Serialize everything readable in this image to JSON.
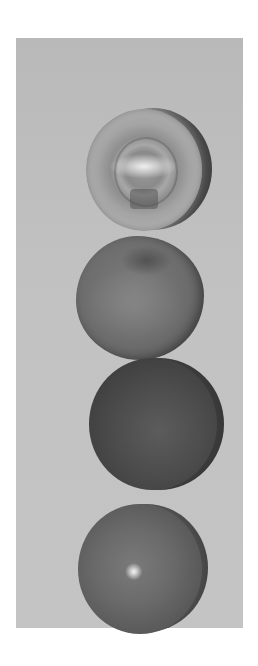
{
  "image": {
    "description": "Grayscale photograph of four spherical balls of different materials stacked vertically against a light gray backdrop",
    "background_color": "#ffffff",
    "backdrop_color": "#c0c0c0",
    "objects": [
      {
        "name": "glass-ball",
        "material": "transparent glass",
        "tone": "#a5a5a5",
        "position": "top"
      },
      {
        "name": "crumpled-ball",
        "material": "wrinkled/crumpled surface",
        "tone": "#6c6c6c",
        "position": "second"
      },
      {
        "name": "matte-ball",
        "material": "dark matte",
        "tone": "#4a4a4a",
        "position": "third"
      },
      {
        "name": "glossy-ball",
        "material": "glossy with specular highlight",
        "tone": "#656565",
        "position": "bottom"
      }
    ]
  }
}
